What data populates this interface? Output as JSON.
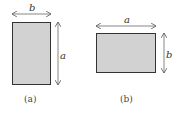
{
  "figures": [
    {
      "id": "a",
      "caption": "(a)",
      "width_label": "b",
      "height_label": "a",
      "fill": "#d2d2d2",
      "stroke": "#333333"
    },
    {
      "id": "b",
      "caption": "(b)",
      "width_label": "a",
      "height_label": "b",
      "fill": "#d2d2d2",
      "stroke": "#333333"
    }
  ],
  "colors": {
    "arrow": "#555555",
    "background": "#ffffff"
  }
}
